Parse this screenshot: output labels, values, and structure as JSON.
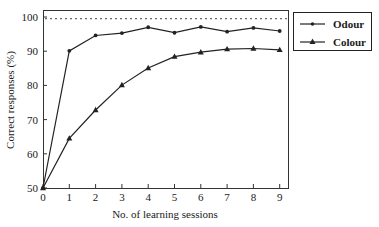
{
  "chart_data": {
    "type": "line",
    "title": "",
    "xlabel": "No. of learning sessions",
    "ylabel": "Correct responses (%)",
    "x": [
      0,
      1,
      2,
      3,
      4,
      5,
      6,
      7,
      8,
      9
    ],
    "xticks": [
      "0",
      "1",
      "2",
      "3",
      "4",
      "5",
      "6",
      "7",
      "8",
      "9"
    ],
    "yticks": [
      "50",
      "60",
      "70",
      "80",
      "90",
      "100"
    ],
    "xlim": [
      0,
      9
    ],
    "ylim": [
      50,
      100
    ],
    "grid": false,
    "reference_line": {
      "y": 99.5,
      "style": "dotted"
    },
    "legend_position": "right-top outside",
    "series": [
      {
        "name": "Odour",
        "marker": "circle",
        "values": [
          50,
          90.1,
          94.6,
          95.3,
          97.0,
          95.4,
          97.1,
          95.7,
          96.8,
          95.9
        ]
      },
      {
        "name": "Colour",
        "marker": "triangle",
        "values": [
          50,
          64.5,
          72.8,
          80.1,
          85.1,
          88.4,
          89.7,
          90.6,
          90.8,
          90.4
        ]
      }
    ]
  },
  "legend": {
    "items": [
      "Odour",
      "Colour"
    ]
  }
}
